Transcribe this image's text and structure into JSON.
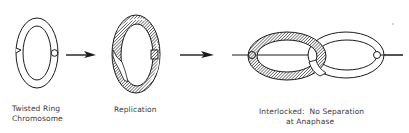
{
  "diagram": {
    "stages": [
      {
        "id": "twisted-ring",
        "label_lines": [
          "Twisted Ring",
          "Chromosome"
        ]
      },
      {
        "id": "replication",
        "label_lines": [
          "Replication"
        ]
      },
      {
        "id": "interlocked",
        "label_lines": [
          "Interlocked:  No Separation",
          "at Anaphase"
        ]
      }
    ],
    "arrows": [
      {
        "from": "twisted-ring",
        "to": "replication"
      },
      {
        "from": "replication",
        "to": "interlocked"
      }
    ],
    "colors": {
      "stroke": "#1a1a1a",
      "hatch": "#2a2a2a",
      "text": "#3a3a3a",
      "background": "#ffffff"
    }
  }
}
